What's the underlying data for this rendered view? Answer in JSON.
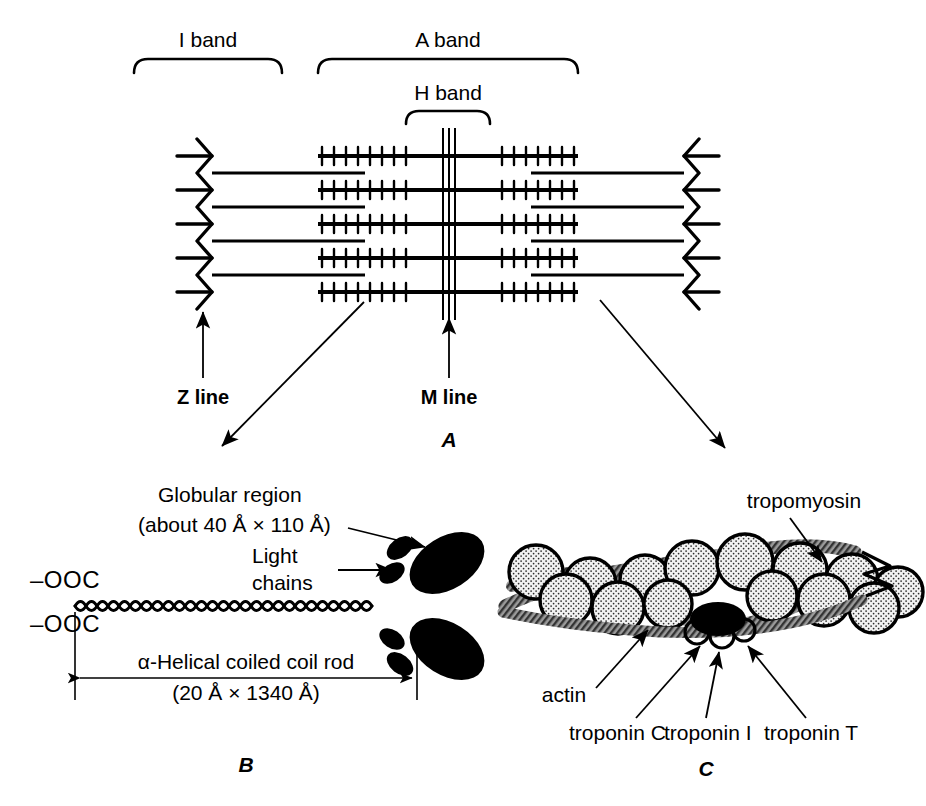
{
  "figure": {
    "ink_color": "#000000",
    "background_color": "#ffffff",
    "actin_fill_color": "#e8e8e8",
    "tropomyosin_fill_color": "#8a8a8a",
    "troponin_fill_color": "#000000"
  },
  "panel_a": {
    "panel_label": "A",
    "brackets": [
      {
        "name": "i-band",
        "label": "I band"
      },
      {
        "name": "a-band",
        "label": "A band"
      },
      {
        "name": "h-band",
        "label": "H band"
      }
    ],
    "callouts": [
      {
        "name": "z-line",
        "label": "Z line"
      },
      {
        "name": "m-line",
        "label": "M line"
      }
    ],
    "filament_rows": 5,
    "m_line_strands": 3
  },
  "panel_b": {
    "panel_label": "B",
    "globular_region_label_line1": "Globular region",
    "globular_region_label_line2": "(about 40 Å × 110 Å)",
    "light_chains_label_line1": "Light",
    "light_chains_label_line2": "chains",
    "c_terminus_upper": "–OOC",
    "c_terminus_lower": "–OOC",
    "rod_label_line1": "α-Helical coiled coil rod",
    "rod_label_line2": "(20 Å × 1340 Å)"
  },
  "panel_c": {
    "panel_label": "C",
    "labels": [
      {
        "name": "tropomyosin",
        "label": "tropomyosin"
      },
      {
        "name": "actin",
        "label": "actin"
      },
      {
        "name": "troponin-c",
        "label": "troponin C"
      },
      {
        "name": "troponin-i",
        "label": "troponin I"
      },
      {
        "name": "troponin-t",
        "label": "troponin T"
      }
    ]
  }
}
